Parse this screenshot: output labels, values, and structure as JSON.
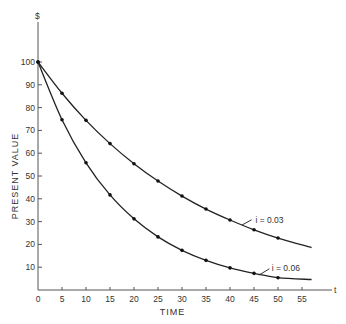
{
  "chart_data": {
    "type": "line",
    "title": "",
    "xlabel": "TIME",
    "ylabel": "PRESENT VALUE",
    "y_unit_label": "$",
    "x_end_label": "t",
    "xlim": [
      0,
      58
    ],
    "ylim": [
      0,
      100
    ],
    "x_ticks": [
      0,
      5,
      10,
      15,
      20,
      25,
      30,
      35,
      40,
      45,
      50,
      55
    ],
    "y_ticks": [
      10,
      20,
      30,
      40,
      50,
      60,
      70,
      80,
      90,
      100
    ],
    "grid": false,
    "x": [
      0,
      5,
      10,
      15,
      20,
      25,
      30,
      35,
      40,
      45,
      50
    ],
    "series": [
      {
        "name": "i = 0.03",
        "values": [
          100,
          86.3,
          74.4,
          64.2,
          55.4,
          47.8,
          41.2,
          35.5,
          30.7,
          26.4,
          22.8
        ],
        "curve_end": {
          "x": 57,
          "y": 18.6
        }
      },
      {
        "name": "i = 0.06",
        "values": [
          100,
          74.7,
          55.8,
          41.7,
          31.2,
          23.3,
          17.4,
          13.0,
          9.7,
          7.3,
          5.4
        ],
        "curve_end": {
          "x": 57,
          "y": 4.6
        }
      }
    ],
    "annotations": [
      {
        "text": "i = 0.03",
        "series": 0
      },
      {
        "text": "i = 0.06",
        "series": 1
      }
    ]
  }
}
